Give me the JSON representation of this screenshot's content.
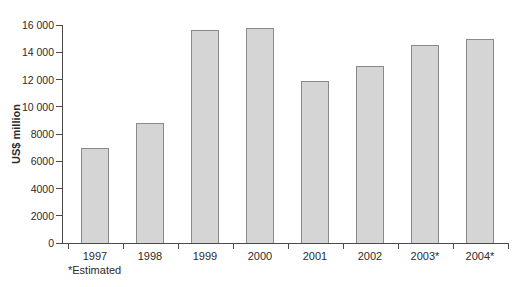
{
  "chart_data": {
    "type": "bar",
    "title": "",
    "xlabel": "",
    "ylabel": "US$ million",
    "categories": [
      "1997",
      "1998",
      "1999",
      "2000",
      "2001",
      "2002",
      "2003*",
      "2004*"
    ],
    "values": [
      7000,
      8800,
      15600,
      15800,
      11900,
      13000,
      14500,
      15000
    ],
    "ylim": [
      0,
      16000
    ],
    "ytick_step": 2000,
    "ytick_labels": [
      "0",
      "2000",
      "4000",
      "6000",
      "8000",
      "10 000",
      "12 000",
      "14 000",
      "16 000"
    ],
    "grid": false,
    "legend": false,
    "footnote": "*Estimated",
    "colors": {
      "bar_fill": "#d5d5d5",
      "bar_border": "#8a8a8a",
      "axis": "#4a4a4a",
      "text": "#2b2b2b",
      "background": "#ffffff"
    }
  }
}
